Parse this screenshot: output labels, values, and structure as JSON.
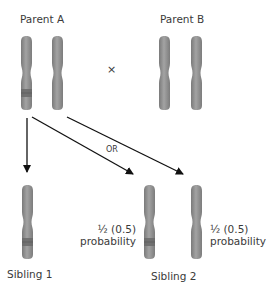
{
  "colors": {
    "chromosome_fill": "#8c8c8c",
    "chromosome_highlight": "#a9a9a9",
    "chromosome_band": "#6e6e6e",
    "arrow": "#111111",
    "text": "#3a3a3a"
  },
  "parents": {
    "a": {
      "label": "Parent A"
    },
    "b": {
      "label": "Parent B"
    },
    "cross_symbol": "×"
  },
  "arrows": {
    "or_label": "OR"
  },
  "siblings": {
    "one": {
      "label": "Sibling 1"
    },
    "two": {
      "label": "Sibling 2",
      "option_left": {
        "fraction": "½ (0.5)",
        "word": "probability"
      },
      "option_right": {
        "fraction": "½ (0.5)",
        "word": "probability"
      }
    }
  }
}
